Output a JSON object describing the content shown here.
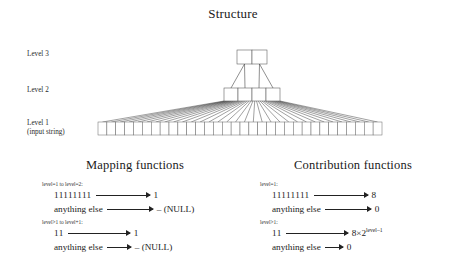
{
  "structure": {
    "title": "Structure",
    "levels": [
      {
        "id": "level3",
        "label": "Level 3",
        "sublabel": "",
        "box_count": 2
      },
      {
        "id": "level2",
        "label": "Level 2",
        "sublabel": "",
        "box_count": 4
      },
      {
        "id": "level1",
        "label": "Level 1",
        "sublabel": "(input string)",
        "box_count": 32
      }
    ],
    "line_color": "#000000",
    "box_stroke": "#555555"
  },
  "mapping": {
    "title": "Mapping functions",
    "groups": [
      {
        "caption": "level=1 to level=2:",
        "rules": [
          {
            "lhs": "11111111",
            "rhs": "1"
          },
          {
            "lhs": "anything else",
            "rhs": "– (NULL)"
          }
        ]
      },
      {
        "caption": "level>1 to level+1:",
        "rules": [
          {
            "lhs": "11",
            "rhs": "1"
          },
          {
            "lhs": "anything else",
            "rhs": "– (NULL)"
          }
        ]
      }
    ]
  },
  "contribution": {
    "title": "Contribution functions",
    "groups": [
      {
        "caption": "level=1:",
        "rules": [
          {
            "lhs": "11111111",
            "rhs": "8",
            "sup": ""
          },
          {
            "lhs": "anything else",
            "rhs": "0",
            "sup": ""
          }
        ]
      },
      {
        "caption": "level>1:",
        "rules": [
          {
            "lhs": "11",
            "rhs": "8×2",
            "sup": "level–1"
          },
          {
            "lhs": "anything else",
            "rhs": "0",
            "sup": ""
          }
        ]
      }
    ]
  }
}
